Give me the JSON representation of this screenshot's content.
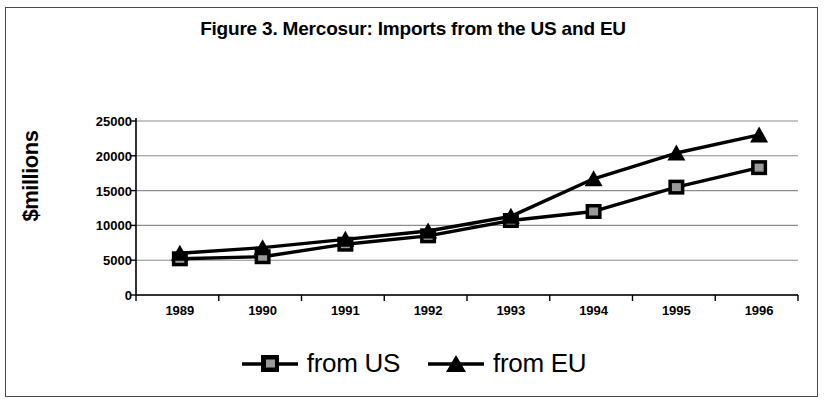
{
  "figure": {
    "title": "Figure 3. Mercosur: Imports from the US and EU",
    "ylabel": "$millions"
  },
  "legend": {
    "items": [
      {
        "label": "from US",
        "marker": "square"
      },
      {
        "label": "from EU",
        "marker": "triangle"
      }
    ]
  },
  "axis": {
    "y_ticks": [
      "0",
      "5000",
      "10000",
      "15000",
      "20000",
      "25000"
    ],
    "x_ticks": [
      "1989",
      "1990",
      "1991",
      "1992",
      "1993",
      "1994",
      "1995",
      "1996"
    ]
  },
  "colors": {
    "line": "#000000",
    "grid": "#8c8c8c",
    "axis": "#000000",
    "background": "#ffffff",
    "frame": "#4a4a4a"
  },
  "chart_data": {
    "type": "line",
    "title": "Figure 3. Mercosur: Imports from the US and EU",
    "xlabel": "",
    "ylabel": "$millions",
    "categories": [
      "1989",
      "1990",
      "1991",
      "1992",
      "1993",
      "1994",
      "1995",
      "1996"
    ],
    "series": [
      {
        "name": "from US",
        "marker": "square",
        "values": [
          5200,
          5500,
          7300,
          8500,
          10700,
          12000,
          15500,
          18300
        ]
      },
      {
        "name": "from EU",
        "marker": "triangle",
        "values": [
          6000,
          6800,
          8000,
          9200,
          11300,
          16700,
          20400,
          23000
        ]
      }
    ],
    "ylim": [
      0,
      25000
    ],
    "ytick_values": [
      0,
      5000,
      10000,
      15000,
      20000,
      25000
    ],
    "grid": true,
    "legend_position": "bottom"
  }
}
